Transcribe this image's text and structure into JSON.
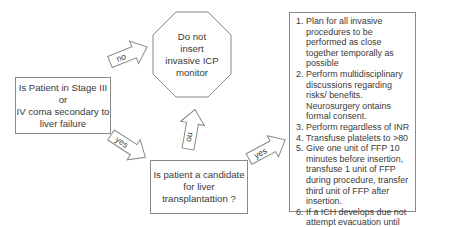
{
  "start_question": {
    "lines": [
      "Is Patient in Stage III",
      "or",
      "IV coma secondary to",
      "liver failure"
    ]
  },
  "no_outcome": {
    "lines": [
      "Do not",
      "insert",
      "invasive ICP",
      "monitor"
    ]
  },
  "candidate_question": {
    "lines": [
      "Is patient a candidate",
      "for liver",
      "transplantattion ?"
    ]
  },
  "arrows": {
    "start_no": "no",
    "start_yes": "yes",
    "candidate_no": "no",
    "candidate_yes": "yes"
  },
  "plan": {
    "items": [
      {
        "num": "1.",
        "text": "Plan for all invasive procedures to be performed as close together temporally as possible"
      },
      {
        "num": "2.",
        "text": "Perform multidisciplinary discussions regarding risks/ benefits.  Neurosurgery ontains formal consent."
      },
      {
        "num": "3.",
        "text": "Perform regardless of INR"
      },
      {
        "num": "4.",
        "text": "Transfuse platelets to >80"
      },
      {
        "num": "5.",
        "text": "Give one unit of FFP 10 minutes before insertion, transfuse 1 unit of FFP during procedure, transfer third unit of FFP after insertion."
      },
      {
        "num": "6.",
        "text": "If a ICH develops due not attempt evacuation until INR is <1.3and platelets >100"
      }
    ]
  }
}
